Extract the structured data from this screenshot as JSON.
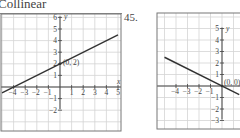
{
  "header": {
    "title": "Collinear"
  },
  "problems": [
    {
      "number": "",
      "point_label": "(0, 2)"
    },
    {
      "number": "45.",
      "point_label": "(0, 0)"
    }
  ],
  "axis_labels": {
    "x": "x",
    "y": "y"
  },
  "chart_data": [
    {
      "type": "line",
      "title": "",
      "xlabel": "x",
      "ylabel": "y",
      "xlim": [
        -5,
        5
      ],
      "ylim": [
        -2,
        6
      ],
      "grid": true,
      "x_ticks": [
        -4,
        -3,
        -2,
        -1,
        1,
        2,
        3,
        4,
        5
      ],
      "y_ticks": [
        6,
        5,
        4,
        3,
        2,
        1,
        -1,
        -2
      ],
      "series": [
        {
          "name": "line",
          "x": [
            -5,
            5
          ],
          "y": [
            -0.5,
            4.5
          ]
        }
      ],
      "annotations": [
        {
          "text": "(0, 2)",
          "x": 0,
          "y": 2
        }
      ]
    },
    {
      "type": "line",
      "title": "45.",
      "xlabel": "x",
      "ylabel": "y",
      "xlim": [
        -5,
        1
      ],
      "ylim": [
        -3,
        5
      ],
      "grid": true,
      "x_ticks": [
        -4,
        -3,
        -2,
        -1
      ],
      "y_ticks": [
        5,
        4,
        3,
        2,
        1,
        -1,
        -2,
        -3
      ],
      "series": [
        {
          "name": "line",
          "x": [
            -5,
            1.5
          ],
          "y": [
            2.5,
            -0.75
          ]
        }
      ],
      "annotations": [
        {
          "text": "(0, 0)",
          "x": 0,
          "y": 0
        }
      ]
    }
  ]
}
